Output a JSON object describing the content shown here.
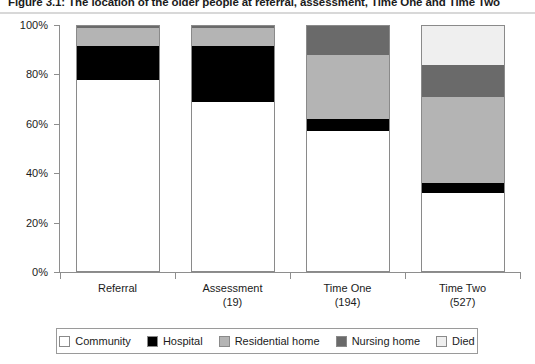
{
  "figure": {
    "title": "Figure 3.1: The location of the older people at referral, assessment, Time One and Time Two"
  },
  "legend": {
    "items": [
      {
        "label": "Community",
        "color": "#ffffff"
      },
      {
        "label": "Hospital",
        "color": "#000000"
      },
      {
        "label": "Residential home",
        "color": "#b4b4b4"
      },
      {
        "label": "Nursing home",
        "color": "#6a6a6a"
      },
      {
        "label": "Died",
        "color": "#efefef"
      }
    ]
  },
  "axes": {
    "y_ticks": [
      "0%",
      "20%",
      "40%",
      "60%",
      "80%",
      "100%"
    ],
    "x_labels": [
      {
        "name": "Referral",
        "count": ""
      },
      {
        "name": "Assessment",
        "count": "(19)"
      },
      {
        "name": "Time One",
        "count": "(194)"
      },
      {
        "name": "Time Two",
        "count": "(527)"
      }
    ]
  },
  "chart_data": {
    "type": "bar",
    "stacked": true,
    "title": "Figure 3.1: The location of the older people at referral, assessment, Time One and Time Two",
    "xlabel": "",
    "ylabel": "",
    "ylim": [
      0,
      100
    ],
    "yticks": [
      0,
      20,
      40,
      60,
      80,
      100
    ],
    "ytick_labels": [
      "0%",
      "20%",
      "40%",
      "60%",
      "80%",
      "100%"
    ],
    "grid": false,
    "legend_position": "bottom",
    "categories": [
      "Referral",
      "Assessment",
      "Time One",
      "Time Two"
    ],
    "category_counts": [
      "",
      "19",
      "194",
      "527"
    ],
    "series": [
      {
        "name": "Community",
        "color": "#ffffff",
        "values": [
          78,
          69,
          57,
          32
        ]
      },
      {
        "name": "Hospital",
        "color": "#000000",
        "values": [
          14,
          23,
          5,
          4
        ]
      },
      {
        "name": "Residential home",
        "color": "#b4b4b4",
        "values": [
          7,
          7,
          26,
          35
        ]
      },
      {
        "name": "Nursing home",
        "color": "#6a6a6a",
        "values": [
          1,
          1,
          12,
          13
        ]
      },
      {
        "name": "Died",
        "color": "#efefef",
        "values": [
          0,
          0,
          0,
          16
        ]
      }
    ]
  }
}
